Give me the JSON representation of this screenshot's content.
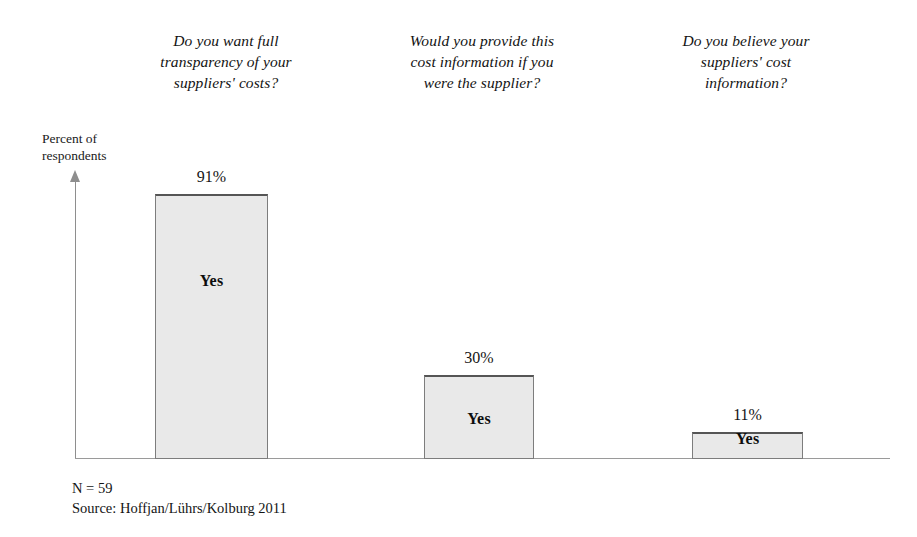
{
  "chart_data": {
    "type": "bar",
    "title": "",
    "categories": [
      "Do you want full transparency of your suppliers' costs?",
      "Would you provide this cost information if you were the supplier?",
      "Do you believe your suppliers' cost information?"
    ],
    "values": [
      91,
      30,
      11
    ],
    "value_labels": [
      "91%",
      "30%",
      "11%"
    ],
    "bar_labels": [
      "Yes",
      "Yes",
      "Yes"
    ],
    "xlabel": "",
    "ylabel": "Percent of respondents",
    "ylim": [
      0,
      100
    ],
    "grid": false,
    "legend": false,
    "bar_fill_color": "#e9e9e9",
    "bar_border_color": "#7d7d7d",
    "axis_color": "#8e8e8e",
    "background_color": "#ffffff"
  },
  "axis": {
    "y_label_line1": "Percent of",
    "y_label_line2": "respondents"
  },
  "questions": [
    {
      "line1": "Do you want full",
      "line2": "transparency of your",
      "line3": "suppliers' costs?"
    },
    {
      "line1": "Would you provide this",
      "line2": "cost information if you",
      "line3": "were the supplier?"
    },
    {
      "line1": "Do you believe your",
      "line2": "suppliers' cost",
      "line3": "information?"
    }
  ],
  "bars": [
    {
      "value_label": "91%",
      "inner_label": "Yes"
    },
    {
      "value_label": "30%",
      "inner_label": "Yes"
    },
    {
      "value_label": "11%",
      "inner_label": "Yes"
    }
  ],
  "footer": {
    "sample_size": "N = 59",
    "source": "Source: Hoffjan/Lührs/Kolburg 2011"
  }
}
